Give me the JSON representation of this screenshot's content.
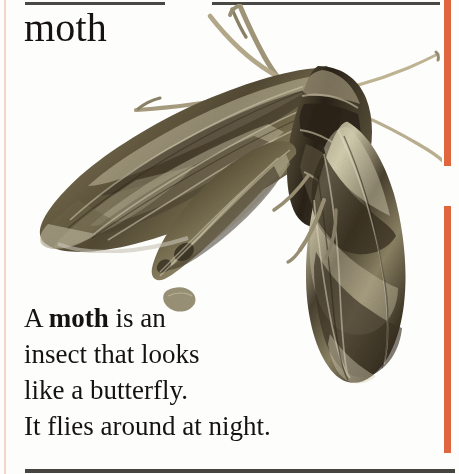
{
  "page": {
    "background_color": "#fdfdfb",
    "width": 459,
    "height": 474
  },
  "headword": {
    "text": "moth"
  },
  "definition": {
    "line1_pre": "A ",
    "line1_bold": "moth",
    "line1_post": " is an",
    "line2": "insect that looks",
    "line3": "like a butterfly.",
    "line4": "It flies around at night.",
    "full_text": "A moth is an insect that looks like a butterfly. It flies around at night."
  },
  "decoration": {
    "rule_color": "#4a4844",
    "left_stripe_color": "#f0cdc0",
    "right_stripe_color": "#e0663f"
  },
  "illustration": {
    "caption": "photograph of an oleander hawk-moth at rest with wings swept back",
    "subject": "moth",
    "palette": {
      "wing_dark": "#3b3124",
      "wing_mid": "#6e6348",
      "wing_olive": "#8c8463",
      "wing_light": "#c9c3a5",
      "wing_pale": "#e4dfc8",
      "body_dark": "#2d2519",
      "leg_tan": "#b9ad8d",
      "antenna": "#cdc3a6"
    }
  }
}
